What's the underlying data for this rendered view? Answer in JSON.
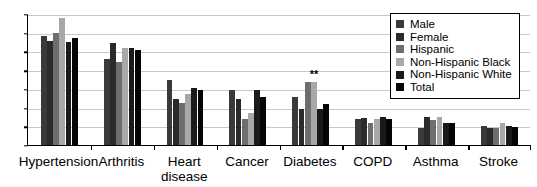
{
  "chart_data": {
    "type": "bar",
    "title": "",
    "subtitle": "",
    "xlabel": "",
    "ylabel": "",
    "ylim": [
      0,
      70
    ],
    "ytick_step": 10,
    "yticks": [
      0,
      10,
      20,
      30,
      40,
      50,
      60,
      70
    ],
    "grid": true,
    "grid_axis": "y",
    "legend_position": "top-right",
    "categories": [
      "Hypertension",
      "Arthritis",
      "Heart\ndisease",
      "Cancer",
      "Diabetes",
      "COPD",
      "Asthma",
      "Stroke"
    ],
    "series": [
      {
        "name": "Male",
        "color": "#3a3a3a",
        "values": [
          58.5,
          46.0,
          35.0,
          29.5,
          25.5,
          14.0,
          9.2,
          10.2
        ]
      },
      {
        "name": "Female",
        "color": "#2b2b2b",
        "values": [
          55.5,
          54.5,
          24.5,
          24.8,
          19.0,
          14.5,
          15.0,
          9.2
        ]
      },
      {
        "name": "Hispanic",
        "color": "#6e6e6e",
        "values": [
          60.0,
          44.5,
          22.5,
          13.8,
          33.5,
          11.8,
          13.5,
          9.0
        ]
      },
      {
        "name": "Non-Hispanic Black",
        "color": "#a8a8a8",
        "values": [
          68.0,
          52.0,
          27.5,
          17.0,
          33.8,
          14.0,
          15.2,
          12.0
        ]
      },
      {
        "name": "Non-Hispanic White",
        "color": "#1a1a1a",
        "values": [
          55.0,
          52.0,
          30.5,
          29.5,
          19.0,
          15.0,
          12.0,
          10.0
        ]
      },
      {
        "name": "Total",
        "color": "#050505",
        "values": [
          57.0,
          51.0,
          29.5,
          25.8,
          21.8,
          14.0,
          12.0,
          9.8
        ]
      }
    ],
    "annotations": [
      {
        "text": "**",
        "category": "Diabetes",
        "series": "Non-Hispanic Black",
        "value": 33.8
      }
    ]
  },
  "legend": {
    "items": [
      {
        "label": "Male"
      },
      {
        "label": "Female"
      },
      {
        "label": "Hispanic"
      },
      {
        "label": "Non-Hispanic Black"
      },
      {
        "label": "Non-Hispanic White"
      },
      {
        "label": "Total"
      }
    ]
  },
  "colors": {
    "axis": "#000000",
    "gridline": "#c8c8c8",
    "background": "#ffffff",
    "text": "#000000"
  }
}
